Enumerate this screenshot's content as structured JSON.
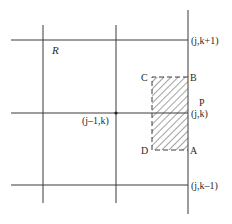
{
  "diagram": {
    "region_label": "R",
    "grid": {
      "vertical_lines_x": [
        43,
        116,
        188
      ],
      "horizontal_lines_y": [
        40,
        113,
        185
      ],
      "line_color": "#3a3a3a"
    },
    "nodes": {
      "top_right": "(j,k+1)",
      "center_right": "(j,k)",
      "bottom_right": "(j,k–1)",
      "center_left": "(j–1,k)"
    },
    "point_label": "P",
    "rectangle": {
      "corners": {
        "A": "A",
        "B": "B",
        "C": "C",
        "D": "D"
      },
      "fill": "hatched"
    }
  }
}
